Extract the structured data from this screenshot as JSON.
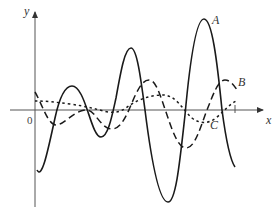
{
  "diagram": {
    "axes": {
      "x_label": "x",
      "y_label": "y",
      "origin_label": "0"
    },
    "curves": [
      {
        "id": "A",
        "label": "A",
        "style": "solid"
      },
      {
        "id": "B",
        "label": "B",
        "style": "long-dash"
      },
      {
        "id": "C",
        "label": "C",
        "style": "short-dash"
      }
    ],
    "colors": {
      "stroke": "#1a1a1a",
      "axis": "#555555",
      "background": "#ffffff"
    }
  }
}
